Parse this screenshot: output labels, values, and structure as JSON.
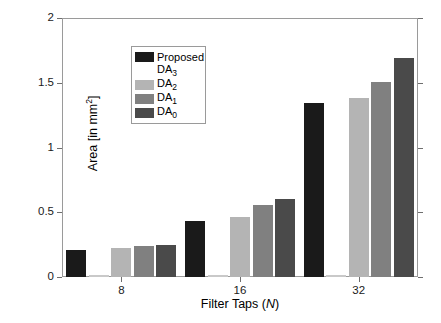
{
  "chart_data": {
    "type": "bar",
    "title": "",
    "xlabel": "Filter Taps (N)",
    "xlabel_plain": "Filter Taps",
    "xlabel_italic_symbol": "N",
    "ylabel": "Area [in mm2]",
    "ylabel_plain": "Area [in mm",
    "ylabel_exponent": "2",
    "ylabel_tail": "]",
    "categories": [
      "8",
      "16",
      "32"
    ],
    "xtick_labels": [
      "8",
      "16",
      "32"
    ],
    "ytick_labels": [
      "0",
      "0.5",
      "1",
      "1.5",
      "2"
    ],
    "ytick_values": [
      0,
      0.5,
      1,
      1.5,
      2
    ],
    "ylim": [
      0,
      2
    ],
    "grid": false,
    "legend_position": "upper-left-inside",
    "series": [
      {
        "name": "Proposed",
        "label_plain": "Proposed",
        "label_sub": "",
        "color": "#1a1a1a",
        "values": [
          0.205,
          0.43,
          1.345
        ]
      },
      {
        "name": "DA3",
        "label_plain": "DA",
        "label_sub": "3",
        "color": "#ffffff",
        "values": [
          0.005,
          0.005,
          0.005
        ]
      },
      {
        "name": "DA2",
        "label_plain": "DA",
        "label_sub": "2",
        "color": "#b4b4b4",
        "values": [
          0.225,
          0.46,
          1.385
        ]
      },
      {
        "name": "DA1",
        "label_plain": "DA",
        "label_sub": "1",
        "color": "#808080",
        "values": [
          0.24,
          0.555,
          1.505
        ]
      },
      {
        "name": "DA0",
        "label_plain": "DA",
        "label_sub": "0",
        "color": "#4a4a4a",
        "values": [
          0.25,
          0.6,
          1.695
        ]
      }
    ]
  },
  "axes": {
    "frame_color": "#9a9a9a",
    "tick_color": "#6e6e6e",
    "background": "#ffffff"
  }
}
